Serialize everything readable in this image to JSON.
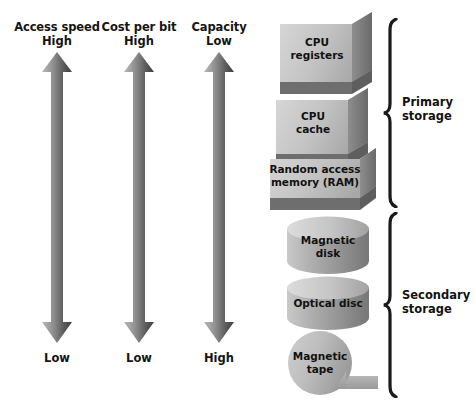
{
  "figure": {
    "background_color": "#ffffff",
    "text_color": "#111111"
  },
  "metrics": [
    {
      "id": "access-speed",
      "name": "Access speed",
      "top_value": "High",
      "bottom_value": "Low",
      "arrow_direction": "up",
      "arrow_color_light": "#bcbcbc",
      "arrow_color_dark": "#4a4a4a"
    },
    {
      "id": "cost-per-bit",
      "name": "Cost per bit",
      "top_value": "High",
      "bottom_value": "Low",
      "arrow_direction": "up",
      "arrow_color_light": "#bcbcbc",
      "arrow_color_dark": "#4a4a4a"
    },
    {
      "id": "capacity",
      "name": "Capacity",
      "top_value": "Low",
      "bottom_value": "High",
      "arrow_direction": "up",
      "arrow_color_light": "#bcbcbc",
      "arrow_color_dark": "#4a4a4a"
    }
  ],
  "storage_levels": [
    {
      "id": "cpu-registers",
      "label_line1": "CPU",
      "label_line2": "registers",
      "shape": "cube",
      "group": "primary"
    },
    {
      "id": "cpu-cache",
      "label_line1": "CPU",
      "label_line2": "cache",
      "shape": "cube",
      "group": "primary"
    },
    {
      "id": "ram",
      "label_line1": "Random access",
      "label_line2": "memory (RAM)",
      "shape": "cube",
      "group": "primary"
    },
    {
      "id": "magnetic-disk",
      "label_line1": "Magnetic",
      "label_line2": "disk",
      "shape": "cylinder",
      "group": "secondary"
    },
    {
      "id": "optical-disc",
      "label_line1": "Optical disc",
      "label_line2": "",
      "shape": "cylinder",
      "group": "secondary"
    },
    {
      "id": "magnetic-tape",
      "label_line1": "Magnetic",
      "label_line2": "tape",
      "shape": "tape-reel",
      "group": "secondary"
    }
  ],
  "groups": [
    {
      "id": "primary",
      "label_line1": "Primary",
      "label_line2": "storage",
      "bracket": "curly-right"
    },
    {
      "id": "secondary",
      "label_line1": "Secondary",
      "label_line2": "storage",
      "bracket": "curly-right"
    }
  ]
}
